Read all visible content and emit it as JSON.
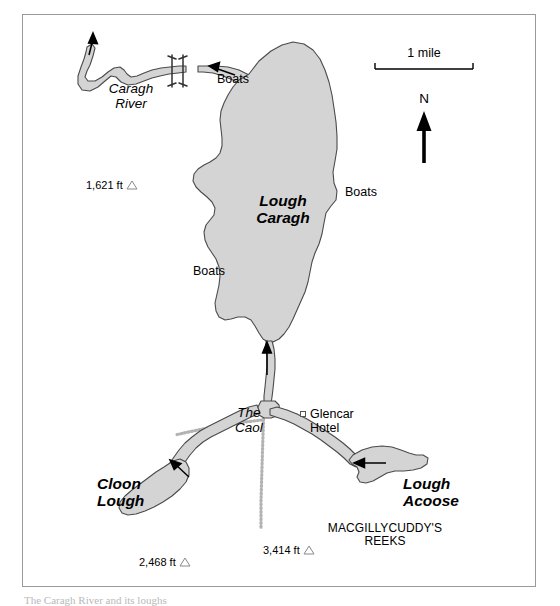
{
  "map": {
    "title": "Lough Caragh and surrounding loughs, County Kerry",
    "frame": {
      "border_color": "#9a9a9a",
      "background": "#ffffff"
    },
    "colors": {
      "water_fill": "#d4d4d4",
      "water_outline": "#4a4a4a",
      "road_dotted": "#b0b0b0",
      "text": "#000000",
      "elevation_symbol": "#8a8a8a"
    },
    "water_labels": [
      {
        "name": "lough-caragh",
        "text": "Lough\nCaragh",
        "style": "bold-italic"
      },
      {
        "name": "cloon-lough",
        "text": "Cloon\nLough",
        "style": "bold-italic"
      },
      {
        "name": "lough-acoose",
        "text": "Lough\nAcoose",
        "style": "bold-italic"
      },
      {
        "name": "caragh-river",
        "text": "Caragh\nRiver",
        "style": "italic"
      },
      {
        "name": "the-caol",
        "text": "The\nCaol",
        "style": "italic"
      }
    ],
    "boat_labels": [
      {
        "name": "boats-north",
        "text": "Boats"
      },
      {
        "name": "boats-east",
        "text": "Boats"
      },
      {
        "name": "boats-west",
        "text": "Boats"
      }
    ],
    "poi": {
      "glencar_hotel": {
        "line1": "Glencar",
        "line2": "Hotel",
        "marker": "square-outline"
      }
    },
    "range_label": {
      "line1": "MACGILLYCUDDY'S",
      "line2": "REEKS"
    },
    "elevations": [
      {
        "name": "elevation-1621",
        "text": "1,621 ft",
        "value_ft": 1621
      },
      {
        "name": "elevation-2468",
        "text": "2,468 ft",
        "value_ft": 2468
      },
      {
        "name": "elevation-3414",
        "text": "3,414 ft",
        "value_ft": 3414
      }
    ],
    "scale_bar": {
      "label": "1 mile",
      "length_px": 98
    },
    "north_arrow": {
      "label": "N"
    }
  },
  "caption": {
    "text": "The Caragh River and its loughs"
  }
}
